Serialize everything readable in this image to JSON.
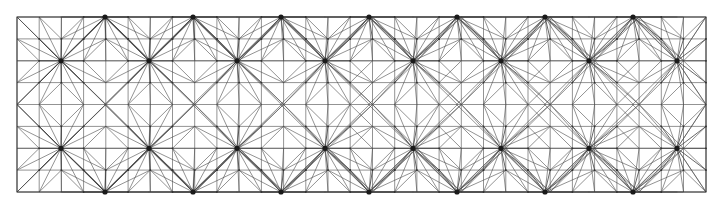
{
  "figure": {
    "kind": "finite-element-mesh",
    "title": "",
    "caption": "",
    "background_color": "#ffffff"
  },
  "chart_data": {
    "type": "diagram",
    "title": "",
    "subtitle": "",
    "xlabel": "",
    "ylabel": "",
    "grid": true,
    "legend": null,
    "annotations": [],
    "domain": {
      "x_min": 17,
      "y_min": 17,
      "x_max": 706,
      "y_max": 192,
      "width": 689,
      "height": 175
    },
    "base_grid": {
      "cell_width": 22.22,
      "cell_height": 21.875,
      "columns": 31,
      "rows": 8,
      "x_ticks": [
        17,
        39.2,
        61.4,
        83.6,
        105.8,
        128.1,
        150.3,
        172.5,
        194.7,
        216.9,
        239.1,
        261.4,
        283.6,
        305.8,
        328.0,
        350.2,
        372.5,
        394.7,
        416.9,
        439.1,
        461.3,
        483.5,
        505.8,
        528.0,
        550.2,
        572.4,
        594.6,
        616.9,
        639.1,
        661.3,
        683.5,
        706
      ],
      "y_ticks": [
        17,
        38.9,
        60.8,
        82.6,
        104.5,
        126.4,
        148.3,
        170.1,
        192
      ]
    },
    "hubs": {
      "spoke_count": 16,
      "node_radius_px": 2.6,
      "node_color": "#1a1a1a",
      "rows_y": [
        60.8,
        148.3
      ],
      "period_x": 88.0,
      "first_x": 61.0,
      "count_per_row": 8,
      "x_positions": [
        61.0,
        149.0,
        237.0,
        325.0,
        413.0,
        501.0,
        589.0,
        677.0
      ]
    },
    "edge_nodes": {
      "description": "Dark high-valence nodes on the top and bottom boundaries, offset half a period from the interior hubs.",
      "rows_y": [
        17,
        192
      ],
      "period_x": 88.0,
      "first_x": 105.0,
      "x_positions": [
        105.0,
        193.0,
        281.0,
        369.0,
        457.0,
        545.0,
        633.0
      ]
    },
    "style": {
      "line_color": "#4a4a4a",
      "line_color_strong": "#333333",
      "line_width": 0.6,
      "line_width_strong": 0.75,
      "border_color": "#3a3a3a",
      "border_width": 1.0
    }
  }
}
